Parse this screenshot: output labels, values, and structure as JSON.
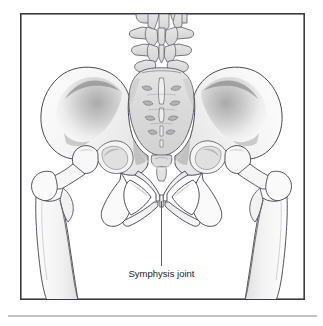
{
  "figure": {
    "name": "pelvis-anatomy-illustration",
    "annotations": [
      {
        "id": "symphysis-joint",
        "label": "Symphysis joint",
        "leader_line": {
          "x1": 161.5,
          "y1": 201,
          "x2": 161.5,
          "y2": 266
        },
        "label_position": {
          "x": 161.5,
          "y": 277
        },
        "text_anchor": "middle"
      }
    ],
    "frame": {
      "x": 20,
      "y": 13,
      "width": 285,
      "height": 287,
      "stroke": "#3a3a42",
      "stroke_width": 1.6,
      "fill": "#ffffff"
    },
    "footer_rule": {
      "x1": 8,
      "y1": 316,
      "x2": 317,
      "y2": 316,
      "stroke": "#8a8a92",
      "stroke_width": 1.2
    },
    "colors": {
      "outline": "#4a4a52",
      "bone_fill": "#fbfbfb",
      "bone_fill_mid": "#f0f0f0",
      "sacrum_fill": "#dedede",
      "vertebra_fill": "#dcdcdc",
      "shadow_dark": "#9a9a9a",
      "shadow_mid": "#c4c4c4",
      "foramen_fill": "#b6b6b6",
      "text": "#1c1c1c",
      "frame_stroke": "#3a3a42",
      "rule_stroke": "#8a8a92",
      "background": "#ffffff"
    },
    "parts": [
      {
        "id": "lumbar-vertebrae",
        "label": "Lumbar vertebrae"
      },
      {
        "id": "sacrum",
        "label": "Sacrum"
      },
      {
        "id": "coccyx",
        "label": "Coccyx"
      },
      {
        "id": "left-ilium",
        "label": "Left ilium"
      },
      {
        "id": "right-ilium",
        "label": "Right ilium"
      },
      {
        "id": "left-obturator-foramen",
        "label": "Left obturator foramen"
      },
      {
        "id": "right-obturator-foramen",
        "label": "Right obturator foramen"
      },
      {
        "id": "left-femur",
        "label": "Left femur"
      },
      {
        "id": "right-femur",
        "label": "Right femur"
      },
      {
        "id": "pubic-symphysis",
        "label": "Pubic symphysis"
      }
    ]
  }
}
